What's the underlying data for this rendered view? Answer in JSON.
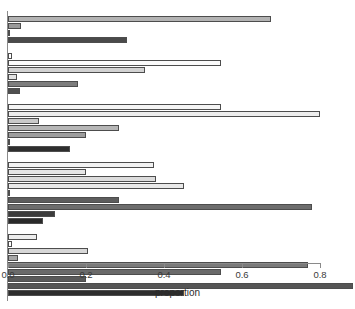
{
  "chart_data": {
    "type": "bar",
    "orientation": "horizontal",
    "title": "",
    "xlabel": "proportion",
    "ylabel": "",
    "xlim": [
      0.0,
      0.9
    ],
    "ylim_categories_hidden": true,
    "grid": false,
    "legend": "none",
    "xticks": [
      0.0,
      0.2,
      0.4,
      0.6,
      0.8
    ],
    "xtick_labels": [
      "0.0",
      "0.2",
      "0.4",
      "0.6",
      "0.8"
    ],
    "axis_color": "#8a8a8a",
    "bar_border_color": "#4d4d4d",
    "groups": [
      {
        "name": "group-1",
        "bars": [
          {
            "value": 0.675,
            "fill": "#b3b3b3"
          },
          {
            "value": 0.033,
            "fill": "#9a9a9a"
          },
          {
            "value": 0.0,
            "fill": "#ffffff"
          },
          {
            "value": 0.305,
            "fill": "#4a4a4a"
          }
        ]
      },
      {
        "name": "group-2",
        "bars": [
          {
            "value": 0.01,
            "fill": "#ffffff"
          },
          {
            "value": 0.545,
            "fill": "#fbfbfb"
          },
          {
            "value": 0.35,
            "fill": "#d2d2d2"
          },
          {
            "value": 0.022,
            "fill": "#e2e2e2"
          },
          {
            "value": 0.18,
            "fill": "#7d7d7d"
          },
          {
            "value": 0.03,
            "fill": "#4f4f4f"
          }
        ]
      },
      {
        "name": "group-3",
        "bars": [
          {
            "value": 0.545,
            "fill": "#f4f4f4"
          },
          {
            "value": 0.8,
            "fill": "#ededed"
          },
          {
            "value": 0.08,
            "fill": "#c9c9c9"
          },
          {
            "value": 0.285,
            "fill": "#b6b6b6"
          },
          {
            "value": 0.2,
            "fill": "#9d9d9d"
          },
          {
            "value": 0.0,
            "fill": "#ffffff"
          },
          {
            "value": 0.16,
            "fill": "#2e2e2e"
          }
        ]
      },
      {
        "name": "group-4",
        "bars": [
          {
            "value": 0.375,
            "fill": "#f2f2f2"
          },
          {
            "value": 0.2,
            "fill": "#e6e6e6"
          },
          {
            "value": 0.38,
            "fill": "#dcdcdc"
          },
          {
            "value": 0.45,
            "fill": "#e9e9e9"
          },
          {
            "value": 0.0,
            "fill": "#ffffff"
          },
          {
            "value": 0.285,
            "fill": "#5d5d5d"
          },
          {
            "value": 0.78,
            "fill": "#6d6d6d"
          },
          {
            "value": 0.12,
            "fill": "#3c3c3c"
          },
          {
            "value": 0.09,
            "fill": "#2a2a2a"
          }
        ]
      },
      {
        "name": "group-5",
        "bars": [
          {
            "value": 0.075,
            "fill": "#ededed"
          },
          {
            "value": 0.01,
            "fill": "#ffffff"
          },
          {
            "value": 0.205,
            "fill": "#d7d7d7"
          },
          {
            "value": 0.025,
            "fill": "#a6a6a6"
          },
          {
            "value": 0.77,
            "fill": "#7a7a7a"
          },
          {
            "value": 0.545,
            "fill": "#6a6a6a"
          },
          {
            "value": 0.2,
            "fill": "#5a5a5a"
          },
          {
            "value": 0.885,
            "fill": "#555555"
          },
          {
            "value": 0.45,
            "fill": "#2d2d2d"
          }
        ]
      }
    ]
  }
}
